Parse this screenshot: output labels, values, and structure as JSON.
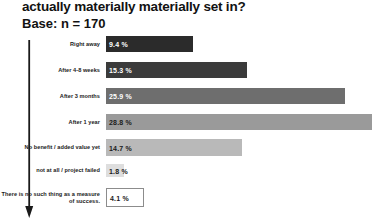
{
  "header": {
    "title": "actually materially materially set in?",
    "base": "Base: n = 170"
  },
  "chart_data": {
    "type": "bar",
    "title": "actually materially materially set in?",
    "subtitle": "Base: n = 170",
    "orientation": "horizontal",
    "xlabel": "",
    "ylabel": "",
    "grid": false,
    "legend": "none",
    "categories": [
      "Right away",
      "After 4-8 weeks",
      "After 3 months",
      "After 1 year",
      "No benefit / added value yet",
      "not at all / project failed",
      "There is no such thing as a measure of success."
    ],
    "values": [
      9.4,
      15.3,
      25.9,
      28.8,
      14.7,
      1.8,
      4.1
    ],
    "value_labels": [
      "9.4 %",
      "15.3 %",
      "25.9 %",
      "28.8 %",
      "14.7 %",
      "1.8 %",
      "4.1 %"
    ],
    "bar_colors": [
      "#2b2b2b",
      "#3b3b3b",
      "#6e6e6e",
      "#9a9a9a",
      "#b9b9b9",
      "#dedede",
      "#ffffff"
    ],
    "value_text_colors": [
      "#ffffff",
      "#ffffff",
      "#ffffff",
      "#1a1a1a",
      "#1a1a1a",
      "#1a1a1a",
      "#1a1a1a"
    ],
    "xlim": [
      0,
      30
    ]
  },
  "axis": {
    "arrow_icon": "down-arrow-icon"
  }
}
